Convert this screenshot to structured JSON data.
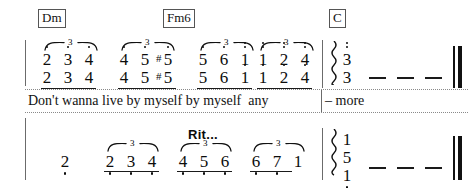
{
  "document": {
    "type": "jianpu-numbered-notation-excerpt",
    "background_color": "#ffffff",
    "ink_color": "#0c0c0c"
  },
  "chords": [
    {
      "label": "Dm",
      "x": 38,
      "y": 9
    },
    {
      "label": "Fm6",
      "x": 163,
      "y": 9
    },
    {
      "label": "C",
      "x": 329,
      "y": 9
    }
  ],
  "expression": {
    "rit": "Rit..."
  },
  "lyrics": {
    "line": "Don't wanna live by myself by myself  any",
    "tail": "– more"
  },
  "staff_top": {
    "groups": [
      {
        "name": "group-1",
        "triplet": "3",
        "upper": [
          {
            "num": "2",
            "octave_up": 1,
            "accidental": ""
          },
          {
            "num": "3",
            "octave_up": 1,
            "accidental": ""
          },
          {
            "num": "4",
            "octave_up": 1,
            "accidental": ""
          }
        ],
        "lower": [
          {
            "num": "2",
            "octave_up": 0,
            "accidental": ""
          },
          {
            "num": "3",
            "octave_up": 0,
            "accidental": ""
          },
          {
            "num": "4",
            "octave_up": 0,
            "accidental": ""
          }
        ]
      },
      {
        "name": "group-2",
        "triplet": "3",
        "upper": [
          {
            "num": "4",
            "octave_up": 1,
            "accidental": ""
          },
          {
            "num": "5",
            "octave_up": 1,
            "accidental": ""
          },
          {
            "num": "5",
            "octave_up": 1,
            "accidental": "#"
          }
        ],
        "lower": [
          {
            "num": "4",
            "octave_up": 0,
            "accidental": ""
          },
          {
            "num": "5",
            "octave_up": 0,
            "accidental": ""
          },
          {
            "num": "5",
            "octave_up": 0,
            "accidental": "#"
          }
        ]
      },
      {
        "name": "group-3",
        "triplet": "3",
        "upper": [
          {
            "num": "5",
            "octave_up": 1,
            "accidental": ""
          },
          {
            "num": "6",
            "octave_up": 1,
            "accidental": ""
          },
          {
            "num": "1",
            "octave_up": 2,
            "accidental": ""
          }
        ],
        "lower": [
          {
            "num": "5",
            "octave_up": 0,
            "accidental": ""
          },
          {
            "num": "6",
            "octave_up": 0,
            "accidental": ""
          },
          {
            "num": "1",
            "octave_up": 1,
            "accidental": ""
          }
        ]
      },
      {
        "name": "group-4",
        "triplet": "3",
        "upper": [
          {
            "num": "1",
            "octave_up": 2,
            "accidental": ""
          },
          {
            "num": "2",
            "octave_up": 2,
            "accidental": ""
          },
          {
            "num": "4",
            "octave_up": 2,
            "accidental": ""
          }
        ],
        "lower": [
          {
            "num": "1",
            "octave_up": 1,
            "accidental": ""
          },
          {
            "num": "2",
            "octave_up": 1,
            "accidental": ""
          },
          {
            "num": "4",
            "octave_up": 1,
            "accidental": ""
          }
        ]
      }
    ],
    "final_chord": {
      "name": "final-chord-top",
      "arpeggio": true,
      "notes": [
        {
          "num": "3",
          "octave_up": 2
        },
        {
          "num": "3",
          "octave_up": 1
        }
      ],
      "sustain_dashes": 3
    }
  },
  "staff_bottom": {
    "pickup": {
      "num": "2",
      "octave_down": 1
    },
    "groups": [
      {
        "name": "group-b1",
        "triplet": "3",
        "notes": [
          {
            "num": "2",
            "octave_down": 1
          },
          {
            "num": "3",
            "octave_down": 1
          },
          {
            "num": "4",
            "octave_down": 1
          }
        ]
      },
      {
        "name": "group-b2",
        "triplet": "3",
        "notes": [
          {
            "num": "4",
            "octave_down": 1
          },
          {
            "num": "5",
            "octave_down": 1
          },
          {
            "num": "6",
            "octave_down": 1
          }
        ]
      },
      {
        "name": "group-b3",
        "triplet": "3",
        "notes": [
          {
            "num": "6",
            "octave_down": 1
          },
          {
            "num": "7",
            "octave_down": 1
          },
          {
            "num": "1",
            "octave_down": 0
          }
        ]
      }
    ],
    "final_chord": {
      "name": "final-chord-bottom",
      "arpeggio": true,
      "notes": [
        {
          "num": "1",
          "octave_down": 0
        },
        {
          "num": "5",
          "octave_down": 0
        },
        {
          "num": "1",
          "octave_down": 1
        }
      ],
      "sustain_dashes": 3
    }
  }
}
